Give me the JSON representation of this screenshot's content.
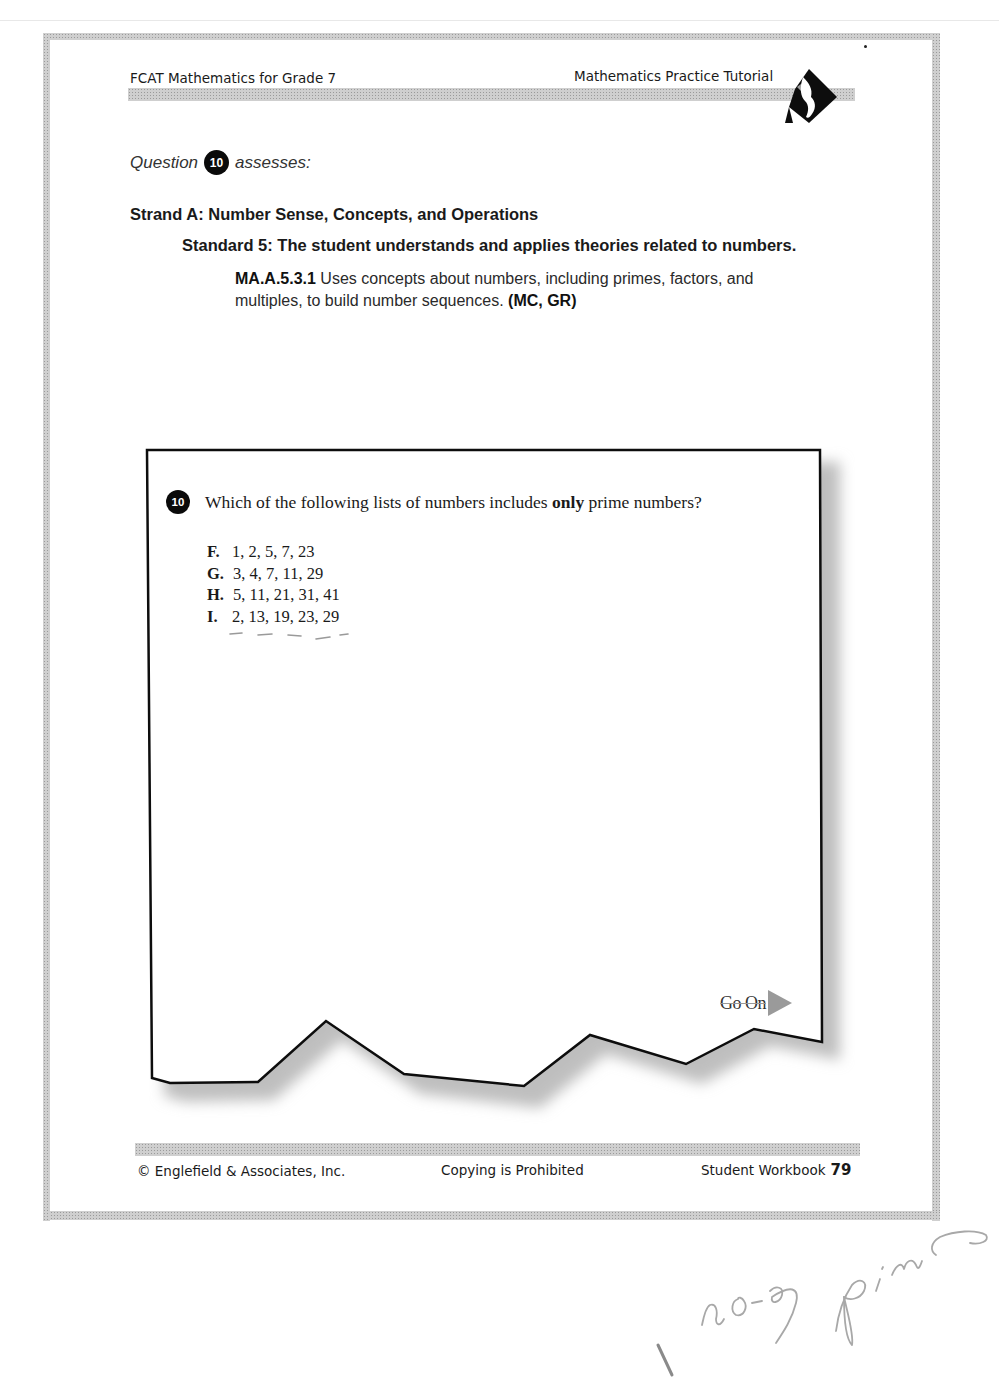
{
  "header": {
    "book_title": "FCAT Mathematics for Grade 7",
    "section_title": "Mathematics Practice Tutorial",
    "logo_icon": "florida-diamond-logo-icon"
  },
  "assessment": {
    "prefix": "Question",
    "question_number": "10",
    "suffix": "assesses:",
    "strand": "Strand A: Number Sense, Concepts, and Operations",
    "standard": "Standard 5: The student understands and applies theories related to numbers.",
    "benchmark_code": "MA.A.5.3.1",
    "benchmark_text": " Uses concepts about numbers, including primes, factors, and multiples, to build number sequences. ",
    "benchmark_types": "(MC, GR)"
  },
  "question": {
    "number": "10",
    "text_before": "Which of the following lists of numbers includes ",
    "text_emphasis": "only",
    "text_after": " prime numbers?",
    "options": [
      {
        "letter": "F.",
        "value": "1, 2, 5, 7, 23"
      },
      {
        "letter": "G.",
        "value": "3, 4, 7, 11, 29"
      },
      {
        "letter": "H.",
        "value": "5, 11, 21, 31, 41"
      },
      {
        "letter": "I.",
        "value": "2, 13, 19, 23, 29"
      }
    ],
    "go_on_label": "Go On",
    "go_on_icon": "arrow-right-icon"
  },
  "footer": {
    "copyright": "© Englefield & Associates, Inc.",
    "notice": "Copying is Prohibited",
    "workbook_label": "Student Workbook",
    "page_number": "79"
  },
  "handwriting": {
    "note": "I no ej primo"
  },
  "colors": {
    "ink": "#111111",
    "dither": "#cfcfcf",
    "arrow": "#9a9a9a",
    "pencil": "#9a9a9a"
  }
}
